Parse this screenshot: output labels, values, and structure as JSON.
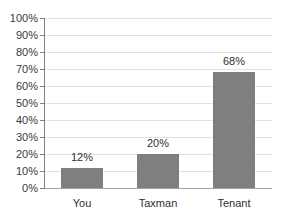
{
  "chart_data": {
    "type": "bar",
    "title": "",
    "subtitle": "",
    "xlabel": "",
    "ylabel": "",
    "categories": [
      "You",
      "Taxman",
      "Tenant"
    ],
    "values": [
      12,
      20,
      68
    ],
    "value_labels": [
      "12%",
      "20%",
      "68%"
    ],
    "ylim": [
      0,
      100
    ],
    "ytick_step": 10,
    "ytick_labels": [
      "0%",
      "10%",
      "20%",
      "30%",
      "40%",
      "50%",
      "60%",
      "70%",
      "80%",
      "90%",
      "100%"
    ],
    "ytick_values": [
      0,
      10,
      20,
      30,
      40,
      50,
      60,
      70,
      80,
      90,
      100
    ],
    "grid": true,
    "legend": false,
    "series": [
      {
        "name": "Share",
        "values": [
          12,
          20,
          68
        ]
      }
    ],
    "colors": {
      "bar": "#7f7f7f",
      "gridline": "#e2e2e2",
      "axis": "#808080",
      "baseline": "#a6a6a6",
      "text": "#2f2f2f",
      "tick_text": "#3a3a3a",
      "background": "#ffffff"
    }
  }
}
